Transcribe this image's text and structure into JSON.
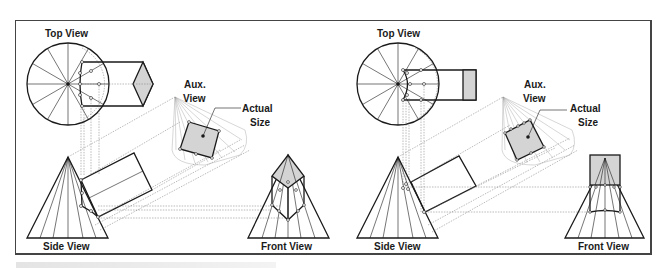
{
  "figure": {
    "panels": [
      {
        "id": "left",
        "description": "Auxiliary view of a hexagonal prism intersecting a cone",
        "labels": {
          "top_view": "Top View",
          "aux_view_line1": "Aux.",
          "aux_view_line2": "View",
          "actual_size_line1": "Actual",
          "actual_size_line2": "Size",
          "side_view": "Side View",
          "front_view": "Front View"
        }
      },
      {
        "id": "right",
        "description": "Auxiliary view of a square prism intersecting a cone",
        "labels": {
          "top_view": "Top View",
          "aux_view_line1": "Aux.",
          "aux_view_line2": "View",
          "actual_size_line1": "Actual",
          "actual_size_line2": "Size",
          "side_view": "Side View",
          "front_view": "Front View"
        }
      }
    ],
    "colors": {
      "line": "#1a1a1a",
      "construction": "#888888",
      "fill": "#d4d4d4",
      "background": "#ffffff"
    }
  }
}
